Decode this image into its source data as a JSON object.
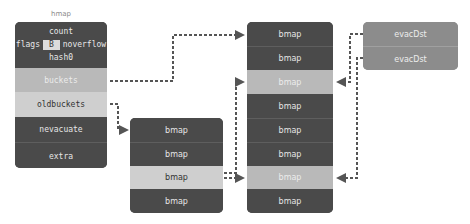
{
  "hmap": {
    "title": "hmap",
    "count": "count",
    "flags": "flags",
    "B": "B",
    "noverflow": "noverflow",
    "hash0": "hash0",
    "buckets": "buckets",
    "oldbuckets": "oldbuckets",
    "nevacuate": "nevacuate",
    "extra": "extra"
  },
  "old_buckets": [
    "bmap",
    "bmap",
    "bmap",
    "bmap"
  ],
  "new_buckets": [
    "bmap",
    "bmap",
    "bmap",
    "bmap",
    "bmap",
    "bmap",
    "bmap",
    "bmap"
  ],
  "evac": [
    "evacDst",
    "evacDst"
  ],
  "colors": {
    "dark": "#4a4a4a",
    "highlight": "#b9b9b9",
    "evac": "#8c8c8c",
    "arrow": "#555555"
  }
}
